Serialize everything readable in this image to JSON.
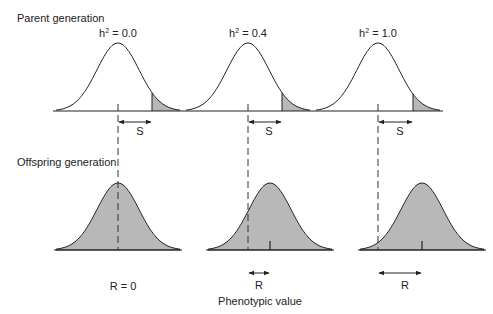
{
  "labels": {
    "parent_generation": "Parent generation",
    "offspring_generation": "Offspring generation",
    "x_axis": "Phenotypic value",
    "selection_differential": "S",
    "response": "R"
  },
  "panels": [
    {
      "h_prefix": "h",
      "h_sup": "2",
      "h_value": " = 0.0",
      "response_label": "R = 0",
      "parent_center_x": 118,
      "offspring_center_x": 118,
      "threshold_x": 152
    },
    {
      "h_prefix": "h",
      "h_sup": "2",
      "h_value": " = 0.4",
      "response_label": "R",
      "parent_center_x": 248,
      "offspring_center_x": 270,
      "threshold_x": 282
    },
    {
      "h_prefix": "h",
      "h_sup": "2",
      "h_value": " = 1.0",
      "response_label": "R",
      "parent_center_x": 378,
      "offspring_center_x": 422,
      "threshold_x": 413
    }
  ],
  "colors": {
    "curve_stroke": "#222222",
    "shade_fill": "#b8b8b8",
    "dashed_line": "#333333"
  }
}
